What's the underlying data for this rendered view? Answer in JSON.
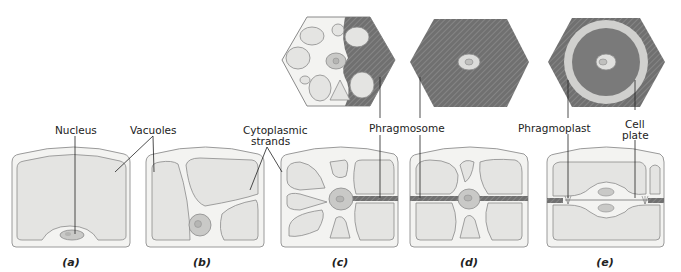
{
  "labels": {
    "nucleus": "Nucleus",
    "vacuoles": "Vacuoles",
    "cytoplasmic_strands_1": "Cytoplasmic",
    "cytoplasmic_strands_2": "strands",
    "phragmosome": "Phragmosome",
    "phragmoplast": "Phragmoplast",
    "cell_plate_1": "Cell",
    "cell_plate_2": "plate"
  },
  "panels": [
    "(a)",
    "(b)",
    "(c)",
    "(d)",
    "(e)"
  ],
  "colors": {
    "cell_wall": "#9a9a9a",
    "cytoplasm": "#f3f3f1",
    "vacuole": "#e4e4e2",
    "vacuole_edge": "#8a8a8a",
    "nucleus": "#c9c9c7",
    "phragmosome": "#6e6e6e",
    "ring": "#cfcfcd",
    "leader": "#222222"
  }
}
